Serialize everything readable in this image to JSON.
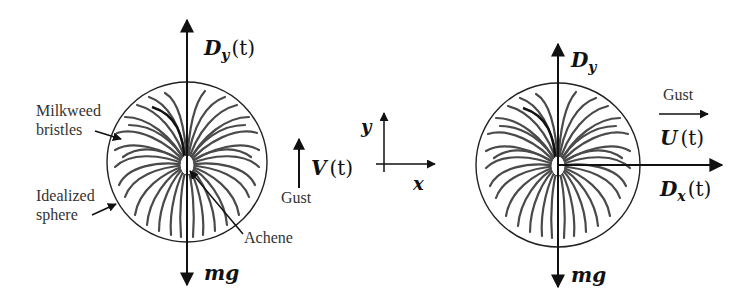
{
  "diagram": {
    "left_panel": {
      "labels": {
        "milkweed_line1": "Milkweed",
        "milkweed_line2": "bristles",
        "idealized_line1": "Idealized",
        "idealized_line2": "sphere",
        "achene": "Achene",
        "gust": "Gust"
      },
      "forces": {
        "up_symbol": "D",
        "up_subscript": "y",
        "up_arg": "(t)",
        "down_label": "mg",
        "gust_symbol": "V",
        "gust_arg": "(t)"
      }
    },
    "axes": {
      "x_label": "x",
      "y_label": "y"
    },
    "right_panel": {
      "labels": {
        "gust": "Gust"
      },
      "forces": {
        "up_symbol": "D",
        "up_subscript": "y",
        "down_label": "mg",
        "horizontal_symbol": "D",
        "horizontal_subscript": "x",
        "horizontal_arg": "(t)",
        "gust_symbol": "U",
        "gust_arg": "(t)"
      }
    },
    "colors": {
      "ink": "#111111",
      "bristles": "#4a4a4a",
      "background": "#ffffff"
    }
  }
}
